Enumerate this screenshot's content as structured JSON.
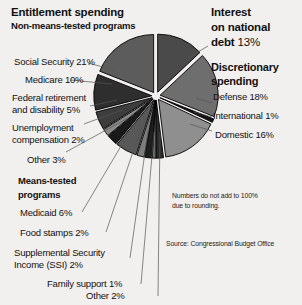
{
  "chart_data": {
    "type": "pie",
    "note": "Numbers do not add to 100% due to rounding.",
    "source": "Source: Congressional Budget Office",
    "units": "percent",
    "total_labeled": 99,
    "explode": true,
    "slices": [
      {
        "label": "Interest on national debt",
        "short": "Interest",
        "value": 13,
        "group": "Interest on national debt",
        "shade": "#4a4a4a",
        "start_deg": 0,
        "end_deg": 46.8
      },
      {
        "label": "Defense",
        "value": 18,
        "group": "Discretionary spending",
        "shade": "#6e6e6e",
        "start_deg": 46.8,
        "end_deg": 111.6
      },
      {
        "label": "International",
        "value": 1,
        "group": "Discretionary spending",
        "shade": "#151515",
        "start_deg": 111.6,
        "end_deg": 115.2
      },
      {
        "label": "Domestic",
        "value": 16,
        "group": "Discretionary spending",
        "shade": "#8f8f8f",
        "start_deg": 115.2,
        "end_deg": 172.8
      },
      {
        "label": "Other",
        "value": 2,
        "group": "Means-tested programs",
        "shade": "#2b2b2b",
        "start_deg": 172.8,
        "end_deg": 180.0
      },
      {
        "label": "Family support",
        "value": 1,
        "group": "Means-tested programs",
        "shade": "#6b6b6b",
        "start_deg": 180.0,
        "end_deg": 183.6
      },
      {
        "label": "Supplemental Security Income (SSI)",
        "value": 2,
        "group": "Means-tested programs",
        "shade": "#1f1f1f",
        "start_deg": 183.6,
        "end_deg": 190.8
      },
      {
        "label": "Food stamps",
        "value": 2,
        "group": "Means-tested programs",
        "shade": "#7d7d7d",
        "start_deg": 190.8,
        "end_deg": 198.0
      },
      {
        "label": "Medicaid",
        "value": 6,
        "group": "Means-tested programs",
        "shade": "#585858",
        "start_deg": 198.0,
        "end_deg": 219.6
      },
      {
        "label": "Other",
        "value": 3,
        "group": "Non-means-tested programs",
        "shade": "#1a1a1a",
        "start_deg": 219.6,
        "end_deg": 230.4
      },
      {
        "label": "Unemployment compensation",
        "value": 2,
        "group": "Non-means-tested programs",
        "shade": "#8a8a8a",
        "start_deg": 230.4,
        "end_deg": 237.6
      },
      {
        "label": "Federal retirement and disability",
        "value": 5,
        "group": "Non-means-tested programs",
        "shade": "#3d3d3d",
        "start_deg": 237.6,
        "end_deg": 255.6
      },
      {
        "label": "Medicare",
        "value": 10,
        "group": "Non-means-tested programs",
        "shade": "#2e2e2e",
        "start_deg": 255.6,
        "end_deg": 291.6
      },
      {
        "label": "Social Security",
        "value": 21,
        "group": "Non-means-tested programs",
        "shade": "#5c5c5c",
        "start_deg": 291.6,
        "end_deg": 360.0
      }
    ]
  },
  "headers": {
    "entitlement": "Entitlement spending",
    "entitlement_sub": "Non-means-tested programs",
    "interest_line1": "Interest",
    "interest_line2": "on national",
    "interest_line3": "debt",
    "interest_pct": "13%",
    "discretionary_line1": "Discretionary",
    "discretionary_line2": "spending",
    "means_line1": "Means-tested",
    "means_line2": "programs"
  },
  "labels": {
    "social_security": "Social Security 21%",
    "medicare": "Medicare 10%",
    "federal_retirement_l1": "Federal retirement",
    "federal_retirement_l2": "and disability 5%",
    "unemployment_l1": "Unemployment",
    "unemployment_l2": "compensation 2%",
    "other_nonmeans": "Other 3%",
    "medicaid": "Medicaid 6%",
    "food_stamps": "Food stamps 2%",
    "ssi_l1": "Supplemental Security",
    "ssi_l2": "Income (SSI) 2%",
    "family_support": "Family support 1%",
    "other_means": "Other 2%",
    "defense": "Defense 18%",
    "international": "International 1%",
    "domestic": "Domestic 16%"
  },
  "notes": {
    "rounding_l1": "Numbers do not add to 100%",
    "rounding_l2": "due to rounding.",
    "source": "Source: Congressional Budget Office"
  },
  "colors": {
    "background": "#f2f0ee",
    "text": "#111111",
    "leader_line": "#555555",
    "slice_outline": "#000000"
  }
}
